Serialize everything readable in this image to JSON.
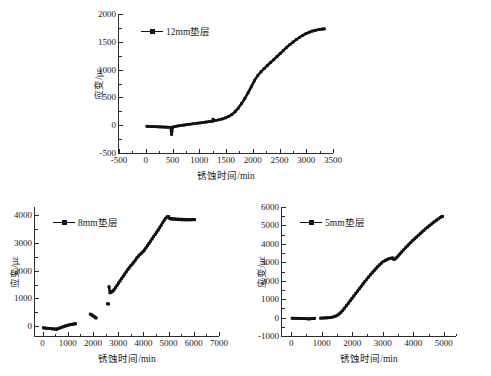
{
  "figure": {
    "axis_label_x": "锈蚀时间/min",
    "axis_label_y": "应变/με",
    "line_color": "#111111",
    "axis_color": "#2b2b2b",
    "background": "#ffffff"
  },
  "panels": [
    {
      "id": "panel-12mm",
      "legend": "12mm垫层",
      "xticks": [
        "-500",
        "0",
        "500",
        "1000",
        "1500",
        "2000",
        "2500",
        "3000",
        "3500"
      ],
      "yticks": [
        "2000",
        "1500",
        "1000",
        "500",
        "0",
        "-500"
      ]
    },
    {
      "id": "panel-8mm",
      "legend": "8mm垫层",
      "xticks": [
        "0",
        "1000",
        "2000",
        "3000",
        "4000",
        "5000",
        "6000",
        "7000"
      ],
      "yticks": [
        "4000",
        "3000",
        "2000",
        "1000",
        "0"
      ]
    },
    {
      "id": "panel-5mm",
      "legend": "5mm垫层",
      "xticks": [
        "0",
        "1000",
        "2000",
        "3000",
        "4000",
        "5000"
      ],
      "yticks": [
        "6000",
        "5000",
        "4000",
        "3000",
        "2000",
        "1000",
        "0",
        "-1000"
      ]
    }
  ],
  "chart_data": [
    {
      "type": "scatter",
      "id": "12mm",
      "title": "",
      "xlabel": "锈蚀时间/min",
      "ylabel": "应变/με",
      "xlim": [
        -500,
        3500
      ],
      "ylim": [
        -500,
        2000
      ],
      "grid": false,
      "legend_position": "upper-left",
      "series": [
        {
          "name": "12mm垫层",
          "x": [
            20,
            60,
            110,
            160,
            210,
            260,
            310,
            360,
            410,
            460,
            480,
            500,
            540,
            590,
            640,
            700,
            760,
            820,
            880,
            940,
            1000,
            1060,
            1120,
            1180,
            1240,
            1250,
            1260,
            1300,
            1360,
            1420,
            1480,
            1540,
            1600,
            1660,
            1720,
            1780,
            1840,
            1900,
            1960,
            2020,
            2080,
            2140,
            2200,
            2260,
            2320,
            2380,
            2440,
            2500,
            2560,
            2620,
            2680,
            2740,
            2800,
            2860,
            2920,
            2980,
            3040,
            3100,
            3160,
            3220,
            3280,
            3320
          ],
          "y": [
            -5,
            -8,
            -10,
            -12,
            -14,
            -16,
            -18,
            -20,
            -22,
            -25,
            -150,
            -20,
            -10,
            0,
            8,
            16,
            24,
            32,
            40,
            48,
            55,
            62,
            70,
            78,
            86,
            120,
            95,
            100,
            112,
            126,
            145,
            170,
            205,
            255,
            320,
            400,
            490,
            590,
            700,
            810,
            900,
            965,
            1025,
            1080,
            1135,
            1185,
            1240,
            1295,
            1350,
            1405,
            1455,
            1500,
            1545,
            1585,
            1620,
            1650,
            1675,
            1695,
            1710,
            1722,
            1730,
            1735
          ]
        }
      ]
    },
    {
      "type": "scatter",
      "id": "8mm",
      "title": "",
      "xlabel": "锈蚀时间/min",
      "ylabel": "应变/με",
      "xlim": [
        -300,
        7000
      ],
      "ylim": [
        -350,
        4300
      ],
      "grid": false,
      "legend_position": "upper-left",
      "series": [
        {
          "name": "8mm垫层-segment-1",
          "x": [
            30,
            90,
            150,
            210,
            270,
            330,
            390,
            450,
            510,
            560,
            600,
            660,
            720,
            780,
            840,
            900,
            960,
            1020,
            1080,
            1140,
            1200,
            1260,
            1300
          ],
          "y": [
            -25,
            -30,
            -35,
            -40,
            -45,
            -52,
            -58,
            -62,
            -66,
            -70,
            -55,
            -35,
            -15,
            5,
            25,
            45,
            60,
            75,
            90,
            100,
            110,
            118,
            125
          ]
        },
        {
          "name": "8mm垫层-segment-2",
          "x": [
            1880,
            1920,
            1960,
            2000,
            2040,
            2080,
            2110
          ],
          "y": [
            470,
            450,
            425,
            400,
            375,
            350,
            330
          ]
        },
        {
          "name": "8mm垫层-segment-3",
          "x": [
            2560,
            2600
          ],
          "y": [
            840,
            830
          ]
        },
        {
          "name": "8mm垫层-segment-4",
          "x": [
            2620,
            2660,
            2700,
            2740,
            2780,
            2820,
            2880,
            2940,
            3000,
            3060,
            3120,
            3180,
            3240,
            3300,
            3360,
            3420,
            3480,
            3540,
            3600,
            3660,
            3720,
            3780,
            3840,
            3900,
            3960,
            4020,
            4080,
            4140,
            4200,
            4260,
            4320,
            4380,
            4440,
            4500,
            4560,
            4620,
            4680,
            4740,
            4800,
            4860,
            4920,
            4970,
            5000,
            5050,
            5100,
            5160,
            5220,
            5280,
            5340,
            5400,
            5460,
            5520,
            5580,
            5640,
            5700,
            5760,
            5820,
            5880,
            5940,
            6000
          ],
          "y": [
            1450,
            1230,
            1250,
            1270,
            1300,
            1340,
            1420,
            1500,
            1580,
            1660,
            1740,
            1820,
            1900,
            1980,
            2060,
            2130,
            2200,
            2260,
            2330,
            2400,
            2480,
            2540,
            2600,
            2650,
            2700,
            2760,
            2840,
            2920,
            3000,
            3080,
            3160,
            3240,
            3320,
            3400,
            3480,
            3560,
            3650,
            3740,
            3830,
            3900,
            3950,
            3960,
            3900,
            3870,
            3890,
            3860,
            3880,
            3850,
            3870,
            3845,
            3865,
            3840,
            3860,
            3835,
            3855,
            3835,
            3850,
            3840,
            3855,
            3845
          ]
        }
      ]
    },
    {
      "type": "scatter",
      "id": "5mm",
      "title": "",
      "xlabel": "锈蚀时间/min",
      "ylabel": "应变/με",
      "xlim": [
        -300,
        5400
      ],
      "ylim": [
        -1000,
        6000
      ],
      "grid": false,
      "legend_position": "upper-left",
      "series": [
        {
          "name": "5mm垫层-segment-1",
          "x": [
            30,
            90,
            150,
            210,
            270,
            330,
            390,
            450,
            510,
            570,
            620,
            670,
            720,
            760
          ],
          "y": [
            10,
            8,
            6,
            5,
            4,
            2,
            0,
            -5,
            -15,
            -30,
            -20,
            -10,
            0,
            5
          ]
        },
        {
          "name": "5mm垫层-segment-2",
          "x": [
            960,
            1020,
            1080,
            1140,
            1200,
            1260,
            1320,
            1380,
            1440,
            1500,
            1560,
            1620,
            1680,
            1740,
            1800,
            1860,
            1920,
            1980,
            2040,
            2100,
            2160,
            2220,
            2280,
            2340,
            2400,
            2460,
            2520,
            2580,
            2640,
            2700,
            2760,
            2820,
            2880,
            2940,
            3000,
            3060,
            3120,
            3180,
            3240,
            3300,
            3340,
            3380,
            3420,
            3480,
            3540,
            3600,
            3660,
            3720,
            3780,
            3840,
            3900,
            3960,
            4020,
            4080,
            4140,
            4200,
            4260,
            4320,
            4380,
            4440,
            4500,
            4560,
            4620,
            4680,
            4740,
            4800,
            4860,
            4900,
            4930
          ],
          "y": [
            15,
            20,
            25,
            30,
            35,
            45,
            60,
            85,
            120,
            170,
            240,
            330,
            440,
            560,
            690,
            820,
            950,
            1080,
            1210,
            1340,
            1470,
            1600,
            1730,
            1860,
            1990,
            2110,
            2230,
            2350,
            2460,
            2570,
            2680,
            2790,
            2890,
            2980,
            3060,
            3120,
            3170,
            3210,
            3240,
            3260,
            3180,
            3200,
            3260,
            3360,
            3470,
            3580,
            3690,
            3800,
            3900,
            4000,
            4100,
            4200,
            4290,
            4380,
            4470,
            4560,
            4650,
            4740,
            4830,
            4910,
            4990,
            5070,
            5150,
            5230,
            5300,
            5370,
            5440,
            5480,
            5500
          ]
        }
      ]
    }
  ]
}
